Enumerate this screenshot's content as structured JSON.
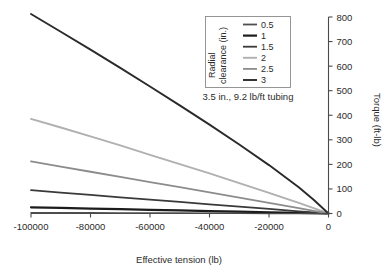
{
  "chart_data": {
    "type": "line",
    "title": "",
    "subtitle": "3.5 in., 9.2 lb/ft tubing",
    "xlabel": "Effective tension (lb)",
    "ylabel": "Torque (ft-lb)",
    "xlim": [
      -100000,
      0
    ],
    "ylim": [
      0,
      800
    ],
    "xticks": [
      -100000,
      -80000,
      -60000,
      -40000,
      -20000,
      0
    ],
    "xtick_labels": [
      "-100000",
      "-80000",
      "-60000",
      "-40000",
      "-20000",
      "0"
    ],
    "yticks": [
      0,
      100,
      200,
      300,
      400,
      500,
      600,
      700,
      800
    ],
    "ytick_labels": [
      "0",
      "100",
      "200",
      "300",
      "400",
      "500",
      "600",
      "700",
      "800"
    ],
    "y_axis_position": "right",
    "grid": false,
    "legend_position": "top-center",
    "legend_title": "Radial clearance (in.)",
    "x": [
      -100000,
      -90000,
      -80000,
      -70000,
      -60000,
      -50000,
      -40000,
      -30000,
      -20000,
      -10000,
      -5000,
      0
    ],
    "series": [
      {
        "name": "0.5",
        "color": "#4f4f4f",
        "width": 1.6,
        "values": [
          3,
          2.7,
          2.4,
          2.1,
          1.8,
          1.5,
          1.2,
          0.9,
          0.6,
          0.3,
          0.15,
          0
        ]
      },
      {
        "name": "1",
        "color": "#1c1c1c",
        "width": 2.2,
        "values": [
          25,
          22.5,
          20,
          17.5,
          15,
          12.5,
          10,
          7.5,
          5,
          2.5,
          1.2,
          0
        ]
      },
      {
        "name": "1.5",
        "color": "#3a3a3a",
        "width": 1.8,
        "values": [
          95,
          85,
          75.5,
          66,
          56.5,
          47,
          37.5,
          28,
          18.5,
          9,
          4.5,
          0
        ]
      },
      {
        "name": "2",
        "color": "#b0b0b0",
        "width": 1.9,
        "values": [
          385,
          350,
          314,
          277,
          239,
          201,
          163,
          124,
          84,
          43,
          21.5,
          0
        ]
      },
      {
        "name": "2.5",
        "color": "#8c8c8c",
        "width": 1.8,
        "values": [
          212,
          191,
          170,
          149,
          128,
          107,
          86,
          65,
          43,
          22,
          11,
          0
        ]
      },
      {
        "name": "3",
        "color": "#2a2a2a",
        "width": 1.9,
        "values": [
          812,
          740,
          667,
          593,
          517,
          440,
          362,
          281,
          197,
          107,
          56,
          0
        ]
      }
    ],
    "legend_order": [
      "0.5",
      "1",
      "1.5",
      "2",
      "2.5",
      "3"
    ]
  },
  "axes": {
    "x_title": "Effective tension (lb)",
    "y_title": "Torque (ft-lb)"
  },
  "legend": {
    "title": "Radial clearance (in.)",
    "entries": [
      {
        "label": "0.5"
      },
      {
        "label": "1"
      },
      {
        "label": "1.5"
      },
      {
        "label": "2"
      },
      {
        "label": "2.5"
      },
      {
        "label": "3"
      }
    ]
  },
  "annotation": {
    "tubing_note": "3.5 in., 9.2 lb/ft tubing"
  }
}
